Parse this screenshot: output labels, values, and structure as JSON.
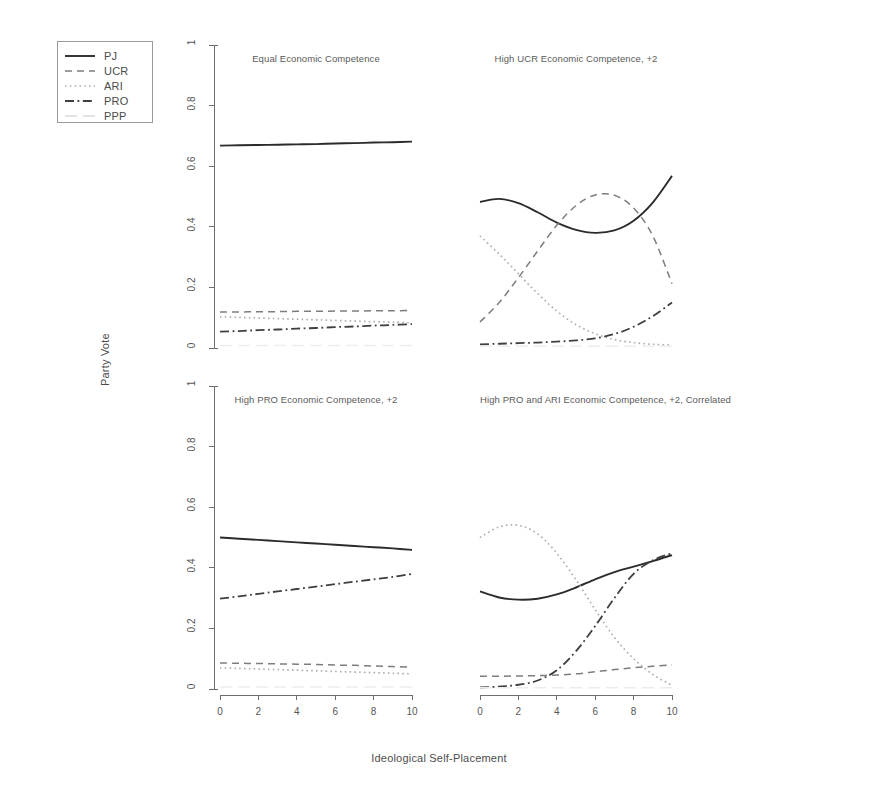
{
  "figure": {
    "xlabel": "Ideological Self-Placement",
    "ylabel": "Party Vote"
  },
  "legend": {
    "entries": [
      {
        "label": "PJ",
        "style": "solid",
        "color": "#2b2b2b"
      },
      {
        "label": "UCR",
        "style": "dashed",
        "color": "#7d7d7d"
      },
      {
        "label": "ARI",
        "style": "dotted",
        "color": "#aeaeae"
      },
      {
        "label": "PRO",
        "style": "dashdot",
        "color": "#3f3f3f"
      },
      {
        "label": "PPP",
        "style": "longdash",
        "color": "#d9d9d9"
      }
    ]
  },
  "axis": {
    "x_ticks": [
      "0",
      "2",
      "4",
      "6",
      "8",
      "10"
    ],
    "y_ticks": [
      "0.0",
      "0.2",
      "0.4",
      "0.6",
      "0.8",
      "1.0"
    ],
    "xlim": [
      0,
      10
    ],
    "ylim": [
      0,
      1
    ]
  },
  "chart_data": {
    "type": "line",
    "title": "",
    "xlabel": "Ideological Self-Placement",
    "ylabel": "Party Vote",
    "xlim": [
      0,
      10
    ],
    "ylim": [
      0,
      1
    ],
    "x_ticks": [
      0,
      2,
      4,
      6,
      8,
      10
    ],
    "y_ticks": [
      0.0,
      0.2,
      0.4,
      0.6,
      0.8,
      1.0
    ],
    "grid": false,
    "legend_position": "upper-left-outside",
    "x": [
      0,
      1,
      2,
      3,
      4,
      5,
      6,
      7,
      8,
      9,
      10
    ],
    "panels": [
      {
        "title": "Equal Economic Competence",
        "row": 0,
        "col": 0,
        "series": [
          {
            "name": "PJ",
            "style": "solid",
            "color": "#2b2b2b",
            "values": [
              0.668,
              0.669,
              0.67,
              0.671,
              0.672,
              0.673,
              0.675,
              0.676,
              0.678,
              0.679,
              0.681
            ]
          },
          {
            "name": "UCR",
            "style": "dashed",
            "color": "#7d7d7d",
            "values": [
              0.119,
              0.119,
              0.12,
              0.12,
              0.121,
              0.121,
              0.122,
              0.122,
              0.123,
              0.123,
              0.124
            ]
          },
          {
            "name": "ARI",
            "style": "dotted",
            "color": "#aeaeae",
            "values": [
              0.103,
              0.101,
              0.099,
              0.097,
              0.095,
              0.093,
              0.091,
              0.089,
              0.087,
              0.085,
              0.083
            ]
          },
          {
            "name": "PRO",
            "style": "dashdot",
            "color": "#3f3f3f",
            "values": [
              0.054,
              0.056,
              0.059,
              0.061,
              0.064,
              0.066,
              0.069,
              0.071,
              0.074,
              0.076,
              0.079
            ]
          },
          {
            "name": "PPP",
            "style": "longdash",
            "color": "#ededed",
            "values": [
              0.008,
              0.008,
              0.008,
              0.008,
              0.008,
              0.008,
              0.008,
              0.008,
              0.008,
              0.008,
              0.008
            ]
          }
        ]
      },
      {
        "title": "High UCR Economic Competence, +2",
        "row": 0,
        "col": 1,
        "series": [
          {
            "name": "PJ",
            "style": "solid",
            "color": "#2b2b2b",
            "values": [
              0.482,
              0.492,
              0.478,
              0.448,
              0.414,
              0.39,
              0.38,
              0.388,
              0.42,
              0.48,
              0.568
            ]
          },
          {
            "name": "UCR",
            "style": "dashed",
            "color": "#7d7d7d",
            "values": [
              0.086,
              0.15,
              0.232,
              0.32,
              0.405,
              0.47,
              0.505,
              0.504,
              0.462,
              0.37,
              0.212
            ]
          },
          {
            "name": "ARI",
            "style": "dotted",
            "color": "#aeaeae",
            "values": [
              0.37,
              0.31,
              0.245,
              0.18,
              0.122,
              0.077,
              0.047,
              0.028,
              0.018,
              0.012,
              0.01
            ]
          },
          {
            "name": "PRO",
            "style": "dashdot",
            "color": "#3f3f3f",
            "values": [
              0.012,
              0.014,
              0.016,
              0.018,
              0.021,
              0.025,
              0.032,
              0.046,
              0.07,
              0.105,
              0.15
            ]
          },
          {
            "name": "PPP",
            "style": "longdash",
            "color": "#ededed",
            "values": [
              0.006,
              0.006,
              0.006,
              0.006,
              0.006,
              0.006,
              0.006,
              0.006,
              0.006,
              0.006,
              0.006
            ]
          }
        ]
      },
      {
        "title": "High PRO Economic Competence, +2",
        "row": 1,
        "col": 0,
        "series": [
          {
            "name": "PJ",
            "style": "solid",
            "color": "#2b2b2b",
            "values": [
              0.5,
              0.496,
              0.492,
              0.488,
              0.484,
              0.48,
              0.476,
              0.472,
              0.468,
              0.464,
              0.459
            ]
          },
          {
            "name": "UCR",
            "style": "dashed",
            "color": "#7d7d7d",
            "values": [
              0.086,
              0.085,
              0.084,
              0.083,
              0.082,
              0.081,
              0.079,
              0.078,
              0.076,
              0.074,
              0.072
            ]
          },
          {
            "name": "ARI",
            "style": "dotted",
            "color": "#aeaeae",
            "values": [
              0.07,
              0.068,
              0.066,
              0.064,
              0.062,
              0.06,
              0.058,
              0.056,
              0.054,
              0.052,
              0.05
            ]
          },
          {
            "name": "PRO",
            "style": "dashdot",
            "color": "#3f3f3f",
            "values": [
              0.298,
              0.306,
              0.314,
              0.322,
              0.33,
              0.338,
              0.346,
              0.354,
              0.362,
              0.37,
              0.38
            ]
          },
          {
            "name": "PPP",
            "style": "longdash",
            "color": "#ededed",
            "values": [
              0.007,
              0.007,
              0.007,
              0.007,
              0.007,
              0.007,
              0.007,
              0.007,
              0.007,
              0.007,
              0.007
            ]
          }
        ]
      },
      {
        "title": "High PRO and ARI Economic Competence, +2, Correlated",
        "row": 1,
        "col": 1,
        "series": [
          {
            "name": "PJ",
            "style": "solid",
            "color": "#2b2b2b",
            "values": [
              0.322,
              0.302,
              0.295,
              0.298,
              0.312,
              0.335,
              0.362,
              0.386,
              0.404,
              0.422,
              0.442
            ]
          },
          {
            "name": "UCR",
            "style": "dashed",
            "color": "#7d7d7d",
            "values": [
              0.042,
              0.042,
              0.043,
              0.044,
              0.046,
              0.05,
              0.057,
              0.064,
              0.07,
              0.075,
              0.08
            ]
          },
          {
            "name": "ARI",
            "style": "dotted",
            "color": "#aeaeae",
            "values": [
              0.5,
              0.535,
              0.54,
              0.512,
              0.448,
              0.36,
              0.262,
              0.17,
              0.1,
              0.048,
              0.012
            ]
          },
          {
            "name": "PRO",
            "style": "dashdot",
            "color": "#3f3f3f",
            "values": [
              0.005,
              0.008,
              0.014,
              0.028,
              0.062,
              0.125,
              0.208,
              0.3,
              0.38,
              0.425,
              0.448
            ]
          },
          {
            "name": "PPP",
            "style": "longdash",
            "color": "#ededed",
            "values": [
              0.004,
              0.004,
              0.004,
              0.004,
              0.004,
              0.004,
              0.004,
              0.004,
              0.004,
              0.004,
              0.004
            ]
          }
        ]
      }
    ]
  }
}
